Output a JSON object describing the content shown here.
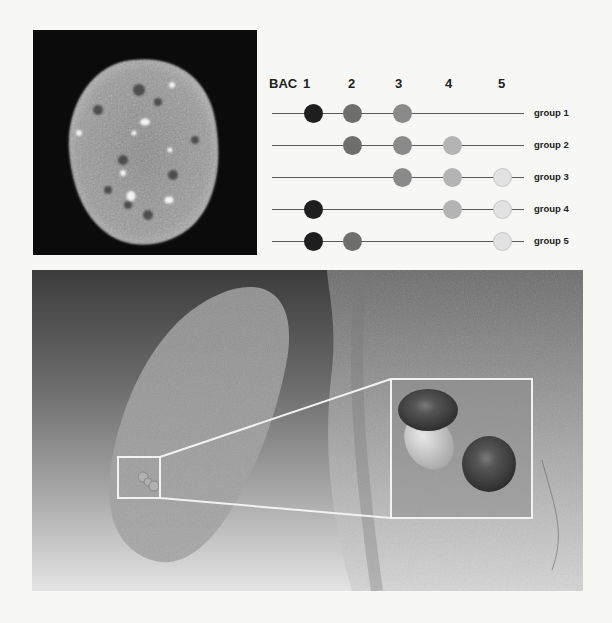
{
  "figure": {
    "panel_a": {
      "description": "Fluorescence image of a cell nucleus with bright BAC signal foci",
      "background_color": "#0b0b0b"
    },
    "panel_b": {
      "header_prefix": "BAC",
      "bac_columns": [
        "1",
        "2",
        "3",
        "4",
        "5"
      ],
      "bac_colors": {
        "1": "#1e1e1e",
        "2": "#6e6e6e",
        "3": "#8a8a8a",
        "4": "#b4b4b4",
        "5": "#e2e2e2"
      },
      "groups": [
        {
          "label": "group 1",
          "bacs": [
            1,
            2,
            3
          ]
        },
        {
          "label": "group 2",
          "bacs": [
            2,
            3,
            4
          ]
        },
        {
          "label": "group 3",
          "bacs": [
            3,
            4,
            5
          ]
        },
        {
          "label": "group 4",
          "bacs": [
            1,
            4,
            5
          ]
        },
        {
          "label": "group 5",
          "bacs": [
            1,
            2,
            5
          ]
        }
      ]
    },
    "panel_c": {
      "description": "3D surface rendering of the nucleus with inset magnifying two dark BAC spheres joined by a lighter body",
      "inset_outline_color": "#f2f2f2"
    }
  }
}
